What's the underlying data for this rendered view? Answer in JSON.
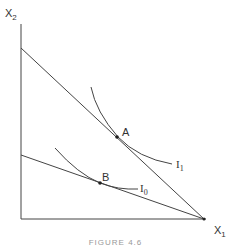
{
  "figure": {
    "y_axis_label": "X",
    "y_axis_sub": "2",
    "x_axis_label": "X",
    "x_axis_sub": "1",
    "points": [
      {
        "label": "A"
      },
      {
        "label": "B"
      }
    ],
    "curves": [
      {
        "label": "I",
        "sub": "1"
      },
      {
        "label": "I",
        "sub": "0"
      }
    ],
    "caption": "FIGURE 4.6"
  },
  "colors": {
    "line": "#444444",
    "text": "#333333"
  }
}
